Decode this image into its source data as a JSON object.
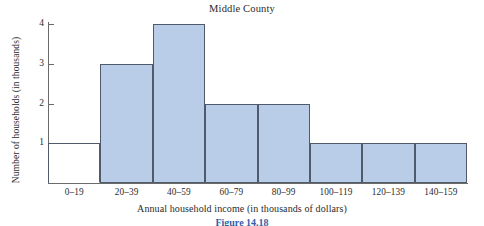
{
  "chart_data": {
    "type": "bar",
    "title": "Middle County",
    "xlabel": "Annual household income (in thousands of dollars)",
    "ylabel": "Number of households (in thousands)",
    "categories": [
      "0–19",
      "20–39",
      "40–59",
      "60–79",
      "80–99",
      "100–119",
      "120–139",
      "140–159"
    ],
    "values": [
      0,
      3,
      4,
      2,
      2,
      1,
      1,
      1
    ],
    "ylim": [
      0,
      4
    ],
    "ytick_labels": [
      "1",
      "2",
      "3",
      "4"
    ],
    "ytick_values": [
      1,
      2,
      3,
      4
    ],
    "grid": false,
    "legend": "none",
    "bar_fill_color": "#b9cce8",
    "bar_stroke_color": "#515a6b",
    "axis_color": "#6a6a6a",
    "background_color": "#ffffff"
  },
  "caption": {
    "text": "Figure 14.18",
    "color": "#2f5fa8"
  }
}
